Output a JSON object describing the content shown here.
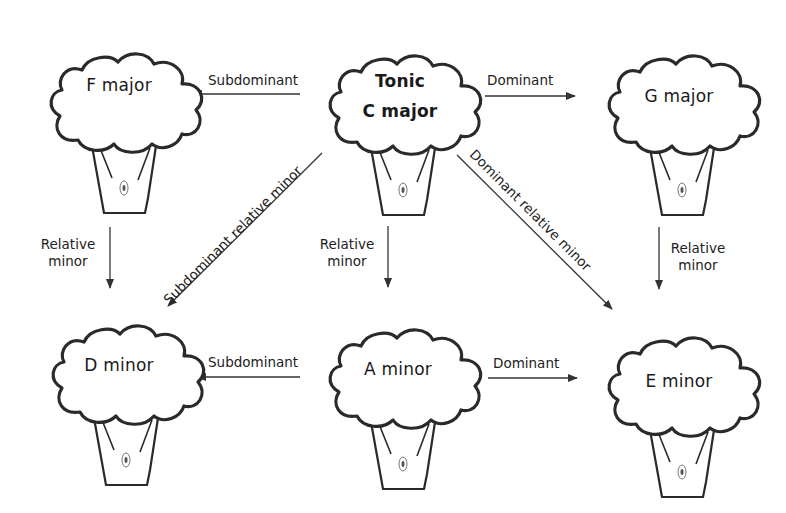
{
  "diagram": {
    "nodes": [
      {
        "id": "f_major",
        "label": "F major",
        "role": "Subdominant"
      },
      {
        "id": "c_major",
        "label_line1": "Tonic",
        "label_line2": "C major",
        "role": "Tonic"
      },
      {
        "id": "g_major",
        "label": "G major",
        "role": "Dominant"
      },
      {
        "id": "d_minor",
        "label": "D minor",
        "role": "Subdominant relative minor"
      },
      {
        "id": "a_minor",
        "label": "A minor",
        "role": "Relative minor"
      },
      {
        "id": "e_minor",
        "label": "E minor",
        "role": "Dominant relative minor"
      }
    ],
    "edges": [
      {
        "from": "c_major",
        "to": "f_major",
        "label": "Subdominant"
      },
      {
        "from": "c_major",
        "to": "g_major",
        "label": "Dominant"
      },
      {
        "from": "f_major",
        "to": "d_minor",
        "label_line1": "Relative",
        "label_line2": "minor"
      },
      {
        "from": "c_major",
        "to": "a_minor",
        "label_line1": "Relative",
        "label_line2": "minor"
      },
      {
        "from": "g_major",
        "to": "e_minor",
        "label_line1": "Relative",
        "label_line2": "minor"
      },
      {
        "from": "c_major",
        "to": "d_minor",
        "label": "Subdominant relative minor"
      },
      {
        "from": "c_major",
        "to": "e_minor",
        "label": "Dominant relative minor"
      },
      {
        "from": "a_minor",
        "to": "d_minor",
        "label": "Subdominant"
      },
      {
        "from": "a_minor",
        "to": "e_minor",
        "label": "Dominant"
      }
    ],
    "colors": {
      "background": "#ffffff",
      "outline": "#2a2a2a",
      "text": "#1a1a1a",
      "arrow": "#333333"
    },
    "icons": {
      "tree": "tree-icon",
      "knot": "trunk-knot-icon"
    }
  }
}
